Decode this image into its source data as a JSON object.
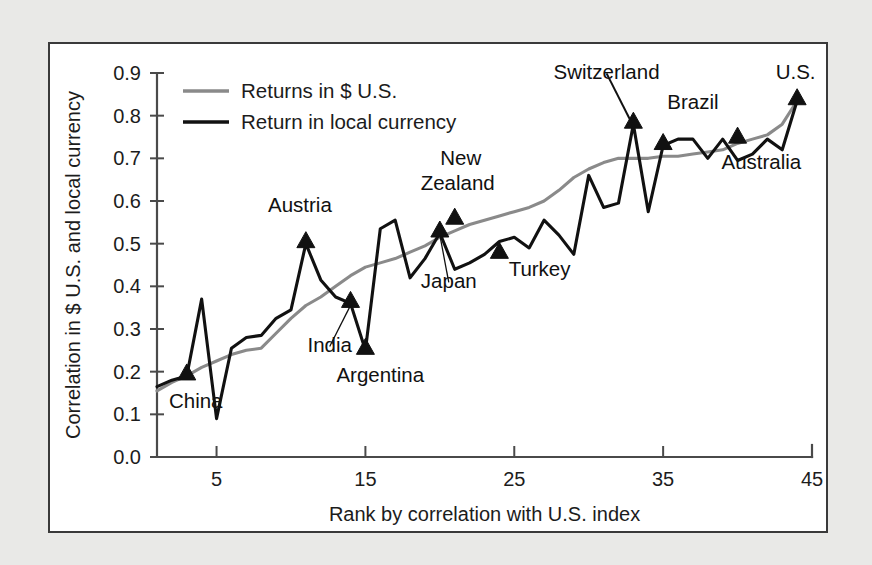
{
  "figure": {
    "background_color": "#e9e9e7",
    "panel_color": "#ffffff",
    "border_color": "#3a3a3a"
  },
  "chart_data": {
    "type": "line",
    "title": "",
    "xlabel": "Rank by correlation with U.S. index",
    "ylabel": "Correlation in $ U.S. and local currency",
    "xlim": [
      1,
      45
    ],
    "ylim": [
      0.0,
      0.9
    ],
    "xticks": [
      5,
      15,
      25,
      35,
      45
    ],
    "xtick_labels": [
      "5",
      "15",
      "25",
      "35",
      "45"
    ],
    "yticks": [
      0.0,
      0.1,
      0.2,
      0.3,
      0.4,
      0.5,
      0.6,
      0.7,
      0.8,
      0.9
    ],
    "ytick_labels": [
      "0.0",
      "0.1",
      "0.2",
      "0.3",
      "0.4",
      "0.5",
      "0.6",
      "0.7",
      "0.8",
      "0.9"
    ],
    "grid": false,
    "legend_position": "top-left",
    "x": [
      1,
      2,
      3,
      4,
      5,
      6,
      7,
      8,
      9,
      10,
      11,
      12,
      13,
      14,
      15,
      16,
      17,
      18,
      19,
      20,
      21,
      22,
      23,
      24,
      25,
      26,
      27,
      28,
      29,
      30,
      31,
      32,
      33,
      34,
      35,
      36,
      37,
      38,
      39,
      40,
      41,
      42,
      43,
      44
    ],
    "series": [
      {
        "name": "Returns in $ U.S.",
        "color": "#8a8a8a",
        "values": [
          0.155,
          0.175,
          0.19,
          0.21,
          0.225,
          0.24,
          0.25,
          0.255,
          0.29,
          0.325,
          0.355,
          0.375,
          0.4,
          0.425,
          0.445,
          0.455,
          0.465,
          0.48,
          0.495,
          0.515,
          0.53,
          0.545,
          0.555,
          0.565,
          0.575,
          0.585,
          0.6,
          0.625,
          0.655,
          0.675,
          0.69,
          0.7,
          0.7,
          0.7,
          0.705,
          0.705,
          0.71,
          0.715,
          0.72,
          0.735,
          0.745,
          0.755,
          0.78,
          0.835
        ]
      },
      {
        "name": "Return in local currency",
        "color": "#111111",
        "values": [
          0.165,
          0.18,
          0.19,
          0.37,
          0.09,
          0.255,
          0.28,
          0.285,
          0.325,
          0.345,
          0.5,
          0.415,
          0.375,
          0.36,
          0.25,
          0.535,
          0.555,
          0.42,
          0.465,
          0.525,
          0.44,
          0.455,
          0.475,
          0.505,
          0.515,
          0.49,
          0.555,
          0.52,
          0.475,
          0.66,
          0.585,
          0.595,
          0.78,
          0.575,
          0.73,
          0.745,
          0.745,
          0.7,
          0.745,
          0.695,
          0.71,
          0.745,
          0.72,
          0.835
        ]
      }
    ],
    "annotations": [
      {
        "label": "China",
        "x": 3,
        "y": 0.19,
        "label_x": 3.6,
        "label_y": 0.115,
        "anchor": "middle",
        "marker": true,
        "leader": false
      },
      {
        "label": "Austria",
        "x": 11,
        "y": 0.5,
        "label_x": 10.6,
        "label_y": 0.575,
        "anchor": "middle",
        "marker": true,
        "leader": false
      },
      {
        "label": "India",
        "x": 14,
        "y": 0.36,
        "label_x": 12.6,
        "label_y": 0.245,
        "anchor": "middle",
        "marker": true,
        "leader": true
      },
      {
        "label": "Argentina",
        "x": 15,
        "y": 0.25,
        "label_x": 16.0,
        "label_y": 0.175,
        "anchor": "middle",
        "marker": true,
        "leader": false
      },
      {
        "label": "Japan",
        "x": 20,
        "y": 0.525,
        "label_x": 20.6,
        "label_y": 0.395,
        "anchor": "middle",
        "marker": true,
        "leader": true
      },
      {
        "label": "New",
        "x": 21,
        "y": 0.555,
        "label_x": 21.4,
        "label_y": 0.685,
        "anchor": "middle",
        "marker": true,
        "leader": false
      },
      {
        "label": "Zealand",
        "x": 21,
        "y": 0.555,
        "label_x": 21.2,
        "label_y": 0.625,
        "anchor": "middle",
        "marker": false,
        "leader": false
      },
      {
        "label": "Turkey",
        "x": 24,
        "y": 0.475,
        "label_x": 26.7,
        "label_y": 0.425,
        "anchor": "middle",
        "marker": true,
        "leader": false
      },
      {
        "label": "Switzerland",
        "x": 33,
        "y": 0.78,
        "label_x": 31.2,
        "label_y": 0.885,
        "anchor": "middle",
        "marker": true,
        "leader": true
      },
      {
        "label": "Brazil",
        "x": 35,
        "y": 0.73,
        "label_x": 37.0,
        "label_y": 0.815,
        "anchor": "middle",
        "marker": true,
        "leader": false
      },
      {
        "label": "Australia",
        "x": 40,
        "y": 0.745,
        "label_x": 41.6,
        "label_y": 0.675,
        "anchor": "middle",
        "marker": true,
        "leader": false
      },
      {
        "label": "U.S.",
        "x": 44,
        "y": 0.835,
        "label_x": 43.9,
        "label_y": 0.885,
        "anchor": "middle",
        "marker": true,
        "leader": false
      }
    ]
  },
  "legend": {
    "items": [
      {
        "label": "Returns in $ U.S.",
        "color": "#8a8a8a"
      },
      {
        "label": "Return in local currency",
        "color": "#111111"
      }
    ]
  }
}
